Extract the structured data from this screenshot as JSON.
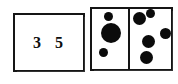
{
  "canvas": {
    "width": 178,
    "height": 84,
    "background": "#ffffff",
    "ink": "#0b0b0b"
  },
  "numeral_card": {
    "name": "numeral-card",
    "value": "3 5",
    "digits": [
      "3",
      "5"
    ],
    "border_color": "#151515",
    "fill_color": "#ffffff",
    "rect": {
      "x": 13,
      "y": 13,
      "w": 72,
      "h": 59
    }
  },
  "dot_card": {
    "name": "dot-card",
    "border_color": "#151515",
    "fill_color": "#ffffff",
    "dot_color": "#0b0b0b",
    "rect": {
      "x": 90,
      "y": 7,
      "w": 83,
      "h": 64
    },
    "divider_x": 128,
    "total_dots": 8,
    "cells": [
      {
        "name": "left-cell",
        "count": 3,
        "dots": [
          {
            "cx": 108,
            "cy": 16,
            "r": 4.5
          },
          {
            "cx": 111,
            "cy": 33,
            "r": 10
          },
          {
            "cx": 103,
            "cy": 52,
            "r": 4.5
          }
        ]
      },
      {
        "name": "right-cell",
        "count": 5,
        "dots": [
          {
            "cx": 139,
            "cy": 18,
            "r": 6.5
          },
          {
            "cx": 150,
            "cy": 13,
            "r": 4.5
          },
          {
            "cx": 165,
            "cy": 33,
            "r": 5.5
          },
          {
            "cx": 148,
            "cy": 41,
            "r": 6.5
          },
          {
            "cx": 146,
            "cy": 57,
            "r": 6.5
          }
        ]
      }
    ]
  }
}
